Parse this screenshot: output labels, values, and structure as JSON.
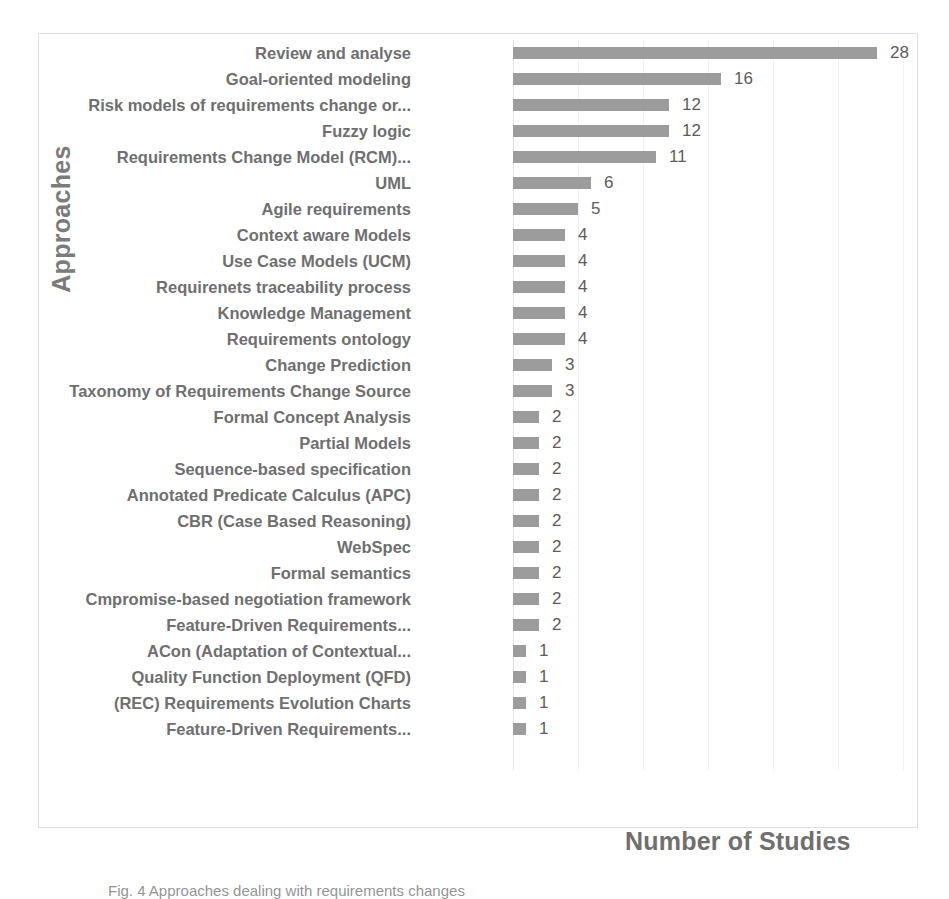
{
  "figure": {
    "caption": "Fig. 4  Approaches dealing with requirements changes",
    "caption_label": "Fig. 4"
  },
  "chart_data": {
    "type": "bar",
    "orientation": "horizontal",
    "title": "",
    "xlabel": "Number of Studies",
    "ylabel": "Approaches",
    "xlim": [
      0,
      31.2
    ],
    "grid": true,
    "gridlines": [
      5,
      10,
      15,
      20,
      25,
      30
    ],
    "legend": "none",
    "bar_color": "#9c9c9c",
    "label_color": "#6f6f6f",
    "categories": [
      "Review and analyse",
      "Goal-oriented modeling",
      "Risk models of requirements change or...",
      "Fuzzy logic",
      "Requirements Change Model (RCM)...",
      "UML",
      "Agile requirements",
      "Context aware Models",
      "Use Case Models (UCM)",
      "Requirenets traceability process",
      "Knowledge Management",
      "Requirements ontology",
      "Change Prediction",
      "Taxonomy of Requirements Change Source",
      "Formal Concept Analysis",
      "Partial Models",
      "Sequence-based specification",
      "Annotated Predicate Calculus (APC)",
      "CBR (Case Based Reasoning)",
      "WebSpec",
      "Formal semantics",
      "Cmpromise-based negotiation framework",
      "Feature-Driven Requirements...",
      "ACon (Adaptation of Contextual...",
      "Quality Function Deployment (QFD)",
      "(REC) Requirements Evolution Charts",
      "Feature-Driven Requirements..."
    ],
    "values": [
      28,
      16,
      12,
      12,
      11,
      6,
      5,
      4,
      4,
      4,
      4,
      4,
      3,
      3,
      2,
      2,
      2,
      2,
      2,
      2,
      2,
      2,
      2,
      1,
      1,
      1,
      1
    ]
  }
}
